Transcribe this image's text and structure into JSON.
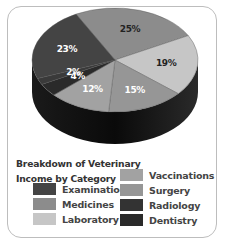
{
  "chart_data": {
    "type": "pie",
    "title": "Breakdown of Veterinary Income by Category",
    "style": "3d",
    "categories": [
      "Examinations",
      "Medicines",
      "Laboratory",
      "Vaccinations",
      "Surgery",
      "Radiology",
      "Dentistry"
    ],
    "slices": [
      {
        "label": "Medicines",
        "value": 25,
        "text": "25%",
        "color": "#8c8c8c"
      },
      {
        "label": "Laboratory",
        "value": 19,
        "text": "19%",
        "color": "#c6c6c6"
      },
      {
        "label": "Surgery",
        "value": 15,
        "text": "15%",
        "color": "#969696"
      },
      {
        "label": "Vaccinations",
        "value": 12,
        "text": "12%",
        "color": "#a2a2a2"
      },
      {
        "label": "Dentistry",
        "value": 4,
        "text": "4%",
        "color": "#2a2a2a"
      },
      {
        "label": "Radiology",
        "value": 2,
        "text": "2%",
        "color": "#3a3a3a"
      },
      {
        "label": "Examinations",
        "value": 23,
        "text": "23%",
        "color": "#444444"
      }
    ],
    "legend": [
      {
        "label": "Examinations",
        "color": "#444444"
      },
      {
        "label": "Medicines",
        "color": "#8c8c8c"
      },
      {
        "label": "Laboratory",
        "color": "#c6c6c6"
      },
      {
        "label": "Vaccinations",
        "color": "#a2a2a2"
      },
      {
        "label": "Surgery",
        "color": "#969696"
      },
      {
        "label": "Radiology",
        "color": "#333333"
      },
      {
        "label": "Dentistry",
        "color": "#2a2a2a"
      }
    ],
    "legend_position": "bottom"
  },
  "title_line1": "Breakdown of Veterinary",
  "title_line2": "Income by Category"
}
